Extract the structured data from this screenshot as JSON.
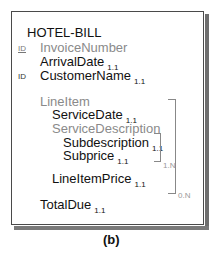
{
  "diagram": {
    "entity": "HOTEL-BILL",
    "attributes": [
      {
        "id_marker": "ID",
        "id_underlined": true,
        "name": "InvoiceNumber",
        "cardinality": "",
        "style": "gray"
      },
      {
        "id_marker": "",
        "name": "ArrivalDate",
        "cardinality": "1.1",
        "style": "black"
      },
      {
        "id_marker": "ID",
        "id_underlined": false,
        "name": "CustomerName",
        "cardinality": "1.1",
        "style": "black"
      }
    ],
    "group": {
      "name": "LineItem",
      "cardinality": "0.N",
      "children": [
        {
          "name": "ServiceDate",
          "cardinality": "1.1"
        },
        {
          "name": "ServiceDescription",
          "cardinality": "1.N",
          "children": [
            {
              "name": "Subdescription",
              "cardinality": "1.1"
            },
            {
              "name": "Subprice",
              "cardinality": "1.1"
            }
          ]
        },
        {
          "name": "LineItemPrice",
          "cardinality": "1.1"
        }
      ]
    },
    "total": {
      "name": "TotalDue",
      "cardinality": "1.1"
    },
    "caption": "(b)"
  }
}
